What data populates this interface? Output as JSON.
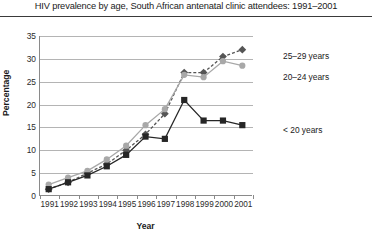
{
  "chart_data": {
    "type": "line",
    "title": "HIV prevalence by age, South African antenatal clinic attendees: 1991–2001",
    "xlabel": "Year",
    "ylabel": "Percentage",
    "categories": [
      "1991",
      "1992",
      "1993",
      "1994",
      "1995",
      "1996",
      "1997",
      "1998",
      "1999",
      "2000",
      "2001"
    ],
    "x": [
      1991,
      1992,
      1993,
      1994,
      1995,
      1996,
      1997,
      1998,
      1999,
      2000,
      2001
    ],
    "ylim": [
      0,
      35
    ],
    "ytick_labels": [
      "0",
      "5",
      "10",
      "15",
      "20",
      "25",
      "30",
      "35"
    ],
    "yticks": [
      0,
      5,
      10,
      15,
      20,
      25,
      30,
      35
    ],
    "grid": true,
    "legend_position": "right",
    "series": [
      {
        "name": "25–29 years",
        "values": [
          1.5,
          3.0,
          5.0,
          7.0,
          10.0,
          13.5,
          18.0,
          27.0,
          27.0,
          30.5,
          32.0
        ],
        "color": "#555555",
        "marker": "diamond",
        "linestyle": "dashed"
      },
      {
        "name": "20–24 years",
        "values": [
          2.5,
          4.0,
          5.5,
          8.0,
          11.0,
          15.5,
          19.0,
          26.5,
          26.0,
          29.5,
          28.5
        ],
        "color": "#a8a8a8",
        "marker": "circle",
        "linestyle": "solid"
      },
      {
        "name": "< 20 years",
        "values": [
          1.5,
          3.0,
          4.5,
          6.5,
          9.0,
          13.0,
          12.5,
          21.0,
          16.5,
          16.5,
          15.5
        ],
        "color": "#262626",
        "marker": "square",
        "linestyle": "solid"
      }
    ]
  },
  "legend": {
    "items": [
      {
        "label": "25–29 years"
      },
      {
        "label": "20–24 years"
      },
      {
        "label": "< 20 years"
      }
    ]
  }
}
